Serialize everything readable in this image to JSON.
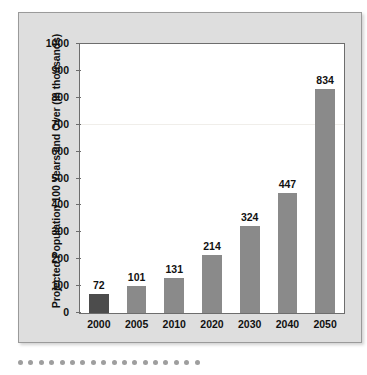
{
  "chart_data": {
    "type": "bar",
    "title": "",
    "xlabel": "",
    "ylabel": "Projected Population 100 Years and Over (in thousands)",
    "categories": [
      "2000",
      "2005",
      "2010",
      "2020",
      "2030",
      "2040",
      "2050"
    ],
    "values": [
      72,
      101,
      131,
      214,
      324,
      447,
      834
    ],
    "ylim": [
      0,
      1000
    ],
    "ytick_labels": [
      "1000",
      "900",
      "800",
      "700",
      "600",
      "500",
      "400",
      "300",
      "200",
      "100",
      "0"
    ],
    "ytick_values": [
      1000,
      900,
      800,
      700,
      600,
      500,
      400,
      300,
      200,
      100,
      0
    ],
    "grid": "single faint horizontal line at 700",
    "gridline_values": [
      700
    ],
    "legend": "none",
    "bar_colors": [
      "#4c4c4c",
      "#8a8a8a",
      "#8a8a8a",
      "#8a8a8a",
      "#8a8a8a",
      "#8a8a8a",
      "#8a8a8a"
    ],
    "value_labels_shown": true,
    "colors": {
      "frame_fill": "#dedede",
      "frame_border": "#9a9a9a",
      "plot_background": "#ffffff",
      "plot_border": "#6d6d6d",
      "bar_default": "#8a8a8a",
      "bar_highlight": "#4c4c4c",
      "text": "#111111",
      "gridline": "#f0eeea",
      "deco_dot": "#9e9e9e"
    }
  },
  "decoration": {
    "dot_count": 18
  }
}
